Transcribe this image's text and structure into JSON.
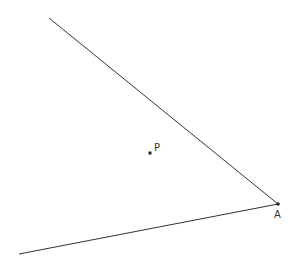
{
  "diagram": {
    "points": [
      {
        "id": "P",
        "label": "P",
        "x": 150,
        "y": 153
      },
      {
        "id": "A",
        "label": "A",
        "x": 278,
        "y": 204
      }
    ],
    "rays": [
      {
        "from": "A",
        "to": [
          49,
          18
        ],
        "name": "upper-ray"
      },
      {
        "from": "A",
        "to": [
          19,
          254
        ],
        "name": "lower-ray"
      }
    ],
    "colors": {
      "line": "#333333",
      "point": "#222222",
      "label": "#333333"
    }
  }
}
